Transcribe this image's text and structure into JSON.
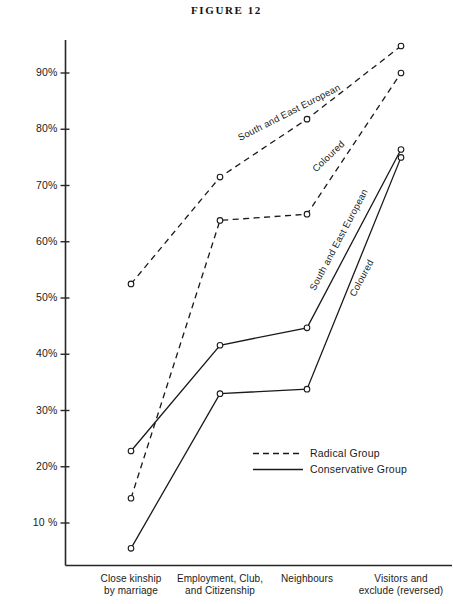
{
  "title": "FIGURE 12",
  "axis": {
    "y_ticks": [
      "10 %",
      "20%",
      "30%",
      "40%",
      "50%",
      "60%",
      "70%",
      "80%",
      "90%"
    ],
    "y_tick_values": [
      10,
      20,
      30,
      40,
      50,
      60,
      70,
      80,
      90
    ],
    "x_categories": [
      {
        "line1": "Close kinship",
        "line2": "by marriage"
      },
      {
        "line1": "Employment, Club,",
        "line2": "and Citizenship"
      },
      {
        "line1": "Neighbours",
        "line2": ""
      },
      {
        "line1": "Visitors and",
        "line2": "exclude (reversed)"
      }
    ]
  },
  "legend": {
    "items": [
      {
        "label": "Radical  Group",
        "style": "dashed"
      },
      {
        "label": "Conservative Group",
        "style": "solid"
      }
    ]
  },
  "curve_labels": {
    "radical_see": "South and East European",
    "radical_coloured": "Coloured",
    "conservative_see": "South and East European",
    "conservative_coloured": "Coloured"
  },
  "chart_data": {
    "type": "line",
    "title": "FIGURE 12",
    "xlabel": "",
    "ylabel": "",
    "ylim": [
      3,
      97
    ],
    "grid": false,
    "legend_position": "inside-center-bottom",
    "categories": [
      "Close kinship by marriage",
      "Employment, Club, and Citizenship",
      "Neighbours",
      "Visitors and exclude (reversed)"
    ],
    "series": [
      {
        "name": "Radical Group — South and East European",
        "style": "dashed",
        "group": "Radical Group",
        "target": "South and East European",
        "values": [
          52.5,
          71.5,
          81.8,
          94.8
        ]
      },
      {
        "name": "Radical Group — Coloured",
        "style": "dashed",
        "group": "Radical Group",
        "target": "Coloured",
        "values": [
          14.4,
          63.8,
          64.9,
          90.0
        ]
      },
      {
        "name": "Conservative Group — South and East European",
        "style": "solid",
        "group": "Conservative Group",
        "target": "South and East European",
        "values": [
          22.8,
          41.6,
          44.7,
          76.4
        ]
      },
      {
        "name": "Conservative Group — Coloured",
        "style": "solid",
        "group": "Conservative Group",
        "target": "Coloured",
        "values": [
          5.5,
          33.0,
          33.8,
          75.0
        ]
      }
    ]
  }
}
